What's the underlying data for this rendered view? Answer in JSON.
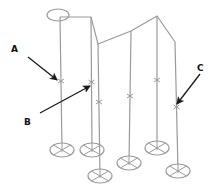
{
  "diagram": {
    "type": "isometric line drawing of poles with footings",
    "colors": {
      "line": "#9a9a9a",
      "arrow": "#1a1a1a",
      "label": "#111111",
      "background": "#ffffff"
    },
    "labels": [
      {
        "id": "A",
        "text": "A",
        "x": 11,
        "y": 45
      },
      {
        "id": "B",
        "text": "B",
        "x": 24,
        "y": 118
      },
      {
        "id": "C",
        "text": "C",
        "x": 197,
        "y": 64
      }
    ],
    "top_ellipse": {
      "cx": 58,
      "cy": 15,
      "rx": 11,
      "ry": 6
    },
    "roofline": [
      [
        60,
        17
      ],
      [
        91,
        17
      ],
      [
        98,
        44
      ],
      [
        131,
        31
      ],
      [
        157,
        16
      ],
      [
        175,
        42
      ]
    ],
    "poles": [
      {
        "id": 1,
        "x_top": 60,
        "y_top": 17,
        "foot_cx": 62,
        "foot_cy": 150,
        "mark_y": 81
      },
      {
        "id": 2,
        "x_top": 91,
        "y_top": 17,
        "foot_cx": 92,
        "foot_cy": 150,
        "mark_y": 82
      },
      {
        "id": 3,
        "x_top": 98,
        "y_top": 44,
        "foot_cx": 100,
        "foot_cy": 176,
        "mark_y": 102
      },
      {
        "id": 4,
        "x_top": 131,
        "y_top": 31,
        "foot_cx": 129,
        "foot_cy": 163,
        "mark_y": 96
      },
      {
        "id": 5,
        "x_top": 157,
        "y_top": 16,
        "foot_cx": 157,
        "foot_cy": 148,
        "mark_y": 80
      },
      {
        "id": 6,
        "x_top": 175,
        "y_top": 42,
        "foot_cx": 178,
        "foot_cy": 171,
        "mark_y": 107
      }
    ],
    "footing": {
      "rx": 12,
      "ry": 7
    },
    "arrows": [
      {
        "label": "A",
        "from": [
          28,
          57
        ],
        "to": [
          57,
          80
        ]
      },
      {
        "label": "B",
        "from": [
          40,
          113
        ],
        "to": [
          90,
          86
        ]
      },
      {
        "label": "C",
        "from": [
          200,
          74
        ],
        "to": [
          177,
          104
        ]
      }
    ]
  }
}
